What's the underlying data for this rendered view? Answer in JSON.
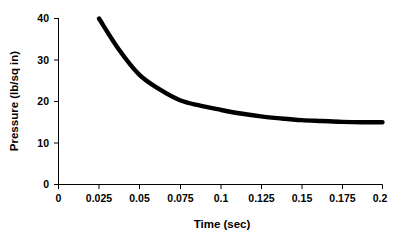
{
  "chart_data": {
    "type": "line",
    "title": "",
    "xlabel": "Time (sec)",
    "ylabel": "Pressure (lb/sq in)",
    "xlim": [
      0,
      0.2
    ],
    "ylim": [
      0,
      40
    ],
    "grid": false,
    "legend": "none",
    "line_color": "#000000",
    "background_color": "#FFFFFF",
    "xticks": [
      "0",
      "0.025",
      "0.05",
      "0.075",
      "0.1",
      "0.125",
      "0.15",
      "0.175",
      "0.2"
    ],
    "xtick_values": [
      0,
      0.025,
      0.05,
      0.075,
      0.1,
      0.125,
      0.15,
      0.175,
      0.2
    ],
    "yticks": [
      "0",
      "10",
      "20",
      "30",
      "40"
    ],
    "ytick_values": [
      0,
      10,
      20,
      30,
      40
    ],
    "x": [
      0.025,
      0.0375,
      0.05,
      0.0625,
      0.075,
      0.0875,
      0.1,
      0.1125,
      0.125,
      0.1375,
      0.15,
      0.1625,
      0.175,
      0.1875,
      0.2
    ],
    "values": [
      40.0,
      32.4,
      26.4,
      22.9,
      20.3,
      19.0,
      18.0,
      17.1,
      16.4,
      15.9,
      15.5,
      15.3,
      15.1,
      15.0,
      15.0
    ],
    "series": [
      {
        "name": "Pressure",
        "x": [
          0.025,
          0.0375,
          0.05,
          0.0625,
          0.075,
          0.0875,
          0.1,
          0.1125,
          0.125,
          0.1375,
          0.15,
          0.1625,
          0.175,
          0.1875,
          0.2
        ],
        "values": [
          40.0,
          32.4,
          26.4,
          22.9,
          20.3,
          19.0,
          18.0,
          17.1,
          16.4,
          15.9,
          15.5,
          15.3,
          15.1,
          15.0,
          15.0
        ]
      }
    ]
  },
  "axes": {
    "x_title": "Time (sec)",
    "y_title": "Pressure (lb/sq in)"
  }
}
